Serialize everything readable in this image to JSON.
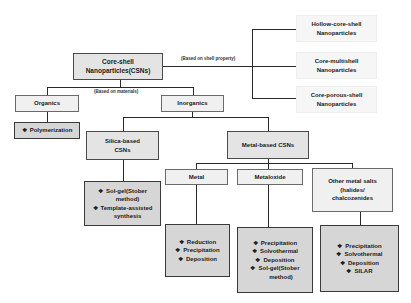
{
  "root": {
    "line1": "Core-shell",
    "line2": "Nanoparticles(CSNs)"
  },
  "annotations": {
    "shell": "(Based on shell property)",
    "materials": "(Based on materials)"
  },
  "shell_types": [
    {
      "line1": "Hollow-core-shell",
      "line2": "Nanoparticles"
    },
    {
      "line1": "Core-multishell",
      "line2": "Nanoparticles"
    },
    {
      "line1": "Core-porous-shell",
      "line2": "Nanoparticles"
    }
  ],
  "organics": {
    "label": "Organics",
    "methods": [
      "Polymerization"
    ]
  },
  "inorganics": {
    "label": "Inorganics"
  },
  "silica": {
    "line1": "Silica-based",
    "line2": "CSNs",
    "methods": [
      "Sol-gel(Stober",
      "method)",
      "Template-assisted",
      "synthesis"
    ]
  },
  "metal_based": {
    "label": "Metal-based CSNs"
  },
  "metal": {
    "label": "Metal",
    "methods": [
      "Reduction",
      "Precipitation",
      "Deposition"
    ]
  },
  "metaloxide": {
    "label": "Metaloxide",
    "methods": [
      "Precipitation",
      "Solvothermal",
      "Deposition",
      "Sol-gel(Stober",
      "method)"
    ]
  },
  "other_salts": {
    "line1": "Other metal salts",
    "line2": "(halides/",
    "line3": "chalcozenides",
    "methods": [
      "Precipitation",
      "Solvothermal",
      "Deposition",
      "SILAR"
    ]
  },
  "bullet": "❖"
}
